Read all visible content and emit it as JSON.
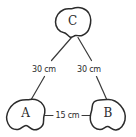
{
  "diagram": {
    "type": "triangle-distance-diagram",
    "background_color": "#ffffff",
    "ink_color": "#2b2b2b",
    "nodes": [
      {
        "id": "A",
        "label": "A",
        "position": "bottom-left",
        "shape": "blob-icon"
      },
      {
        "id": "B",
        "label": "B",
        "position": "bottom-right",
        "shape": "blob-icon"
      },
      {
        "id": "C",
        "label": "C",
        "position": "top-center",
        "shape": "blob-icon"
      }
    ],
    "edges": [
      {
        "id": "CA",
        "from": "C",
        "to": "A",
        "label": "30 cm"
      },
      {
        "id": "CB",
        "from": "C",
        "to": "B",
        "label": "30 cm"
      },
      {
        "id": "AB",
        "from": "A",
        "to": "B",
        "label": "15 cm"
      }
    ]
  }
}
